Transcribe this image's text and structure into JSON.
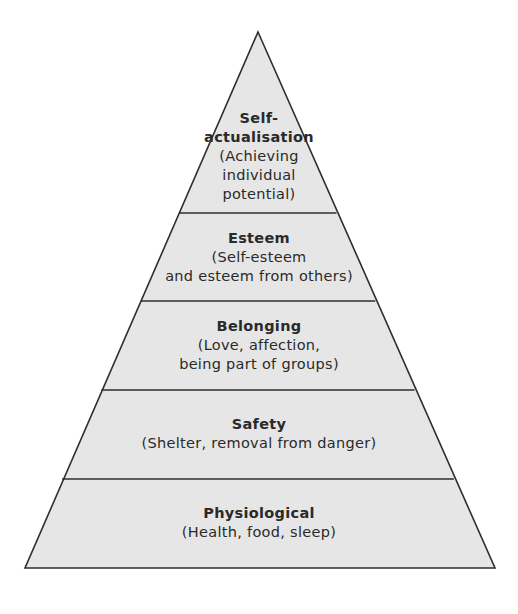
{
  "diagram": {
    "type": "pyramid",
    "colors": {
      "fill": "#e6e6e6",
      "stroke": "#2e2e2e",
      "text": "#2a2a2a",
      "background": "#ffffff"
    },
    "tiers": [
      {
        "title": "Self-\nactualisation",
        "description": "(Achieving\nindividual\npotential)"
      },
      {
        "title": "Esteem",
        "description": "(Self-esteem\nand esteem from others)"
      },
      {
        "title": "Belonging",
        "description": "(Love, affection,\nbeing part of groups)"
      },
      {
        "title": "Safety",
        "description": "(Shelter, removal from danger)"
      },
      {
        "title": "Physiological",
        "description": "(Health, food, sleep)"
      }
    ]
  }
}
